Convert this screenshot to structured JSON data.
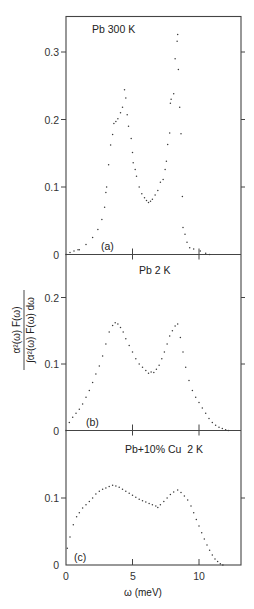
{
  "figure": {
    "xlabel": "ω (meV)",
    "ylabel_numerator": "α²(ω) F(ω)",
    "ylabel_denominator": "∫α²(ω) F(ω) dω",
    "x_ticks": [
      0,
      5,
      10
    ],
    "x_tick_labels": [
      "0",
      "5",
      "10"
    ]
  },
  "chart_data": [
    {
      "type": "scatter",
      "panel": "(a)",
      "title": "Pb 300 K",
      "xlabel": "ω (meV)",
      "ylabel": "α²(ω)F(ω) / ∫α²(ω)F(ω)dω",
      "xlim": [
        0,
        13.2
      ],
      "ylim": [
        0,
        0.35
      ],
      "y_ticks": [
        0,
        0.1,
        0.2,
        0.3
      ],
      "y_tick_labels": [
        "0",
        "0.1",
        "0.2",
        "0.3"
      ],
      "grid": false,
      "x": [
        0.0,
        0.3,
        0.6,
        0.9,
        1.0,
        1.5,
        2.0,
        2.4,
        2.7,
        2.9,
        3.0,
        3.05,
        3.2,
        3.35,
        3.5,
        3.6,
        3.75,
        3.9,
        4.1,
        4.25,
        4.4,
        4.5,
        4.6,
        4.7,
        4.9,
        5.0,
        5.05,
        5.2,
        5.3,
        5.5,
        5.7,
        5.9,
        6.05,
        6.2,
        6.35,
        6.5,
        6.7,
        6.9,
        7.1,
        7.3,
        7.45,
        7.55,
        7.65,
        7.8,
        7.85,
        7.9,
        8.1,
        8.2,
        8.35,
        8.4,
        8.45,
        8.55,
        8.65,
        8.75,
        8.8,
        8.95,
        9.1,
        9.3,
        9.6,
        10.1,
        10.5,
        10.8
      ],
      "y": [
        0.0,
        0.003,
        0.005,
        0.007,
        0.007,
        0.015,
        0.025,
        0.037,
        0.052,
        0.07,
        0.092,
        0.1,
        0.133,
        0.162,
        0.178,
        0.194,
        0.197,
        0.201,
        0.21,
        0.218,
        0.244,
        0.232,
        0.207,
        0.19,
        0.172,
        0.151,
        0.136,
        0.126,
        0.116,
        0.1,
        0.09,
        0.084,
        0.08,
        0.077,
        0.079,
        0.082,
        0.088,
        0.095,
        0.107,
        0.111,
        0.126,
        0.138,
        0.163,
        0.18,
        0.224,
        0.23,
        0.238,
        0.29,
        0.316,
        0.326,
        0.274,
        0.218,
        0.179,
        0.086,
        0.04,
        0.03,
        0.018,
        0.01,
        0.008,
        0.005,
        0.002,
        0.0
      ]
    },
    {
      "type": "scatter",
      "panel": "(b)",
      "title": "Pb 2 K",
      "xlabel": "ω (meV)",
      "ylabel": "α²(ω)F(ω) / ∫α²(ω)F(ω)dω",
      "xlim": [
        0,
        13.2
      ],
      "ylim": [
        0,
        0.26
      ],
      "y_ticks": [
        0,
        0.1,
        0.2
      ],
      "y_tick_labels": [
        "0",
        "0.1",
        "0.2"
      ],
      "grid": false,
      "x": [
        0.0,
        0.25,
        0.5,
        0.75,
        1.0,
        1.25,
        1.5,
        1.75,
        2.0,
        2.25,
        2.5,
        2.75,
        3.0,
        3.25,
        3.5,
        3.7,
        3.9,
        4.1,
        4.3,
        4.5,
        4.75,
        5.0,
        5.25,
        5.5,
        5.75,
        6.0,
        6.2,
        6.4,
        6.6,
        6.8,
        7.0,
        7.2,
        7.4,
        7.6,
        7.8,
        8.0,
        8.2,
        8.4,
        8.6,
        8.8,
        9.0,
        9.25,
        9.5,
        9.75,
        10.0,
        10.25,
        10.5,
        10.75,
        11.0,
        11.25,
        11.5,
        11.75,
        12.0,
        12.2
      ],
      "y": [
        0.0,
        0.012,
        0.02,
        0.026,
        0.032,
        0.04,
        0.05,
        0.06,
        0.072,
        0.085,
        0.097,
        0.112,
        0.13,
        0.148,
        0.158,
        0.162,
        0.16,
        0.155,
        0.148,
        0.138,
        0.128,
        0.118,
        0.108,
        0.1,
        0.095,
        0.09,
        0.086,
        0.088,
        0.087,
        0.092,
        0.098,
        0.108,
        0.118,
        0.13,
        0.142,
        0.15,
        0.157,
        0.16,
        0.14,
        0.118,
        0.095,
        0.075,
        0.06,
        0.05,
        0.042,
        0.034,
        0.026,
        0.018,
        0.012,
        0.008,
        0.005,
        0.003,
        0.001,
        0.0
      ]
    },
    {
      "type": "scatter",
      "panel": "(c)",
      "title": "Pb+10% Cu  2 K",
      "xlabel": "ω (meV)",
      "ylabel": "α²(ω)F(ω) / ∫α²(ω)F(ω)dω",
      "xlim": [
        0,
        13.2
      ],
      "ylim": [
        0,
        0.19
      ],
      "y_ticks": [
        0,
        0.1
      ],
      "y_tick_labels": [
        "0",
        "0.1"
      ],
      "grid": false,
      "x": [
        0.1,
        0.3,
        0.55,
        0.8,
        1.0,
        1.25,
        1.5,
        1.75,
        2.0,
        2.25,
        2.5,
        2.75,
        3.0,
        3.25,
        3.5,
        3.75,
        4.0,
        4.25,
        4.5,
        4.75,
        5.0,
        5.25,
        5.5,
        5.75,
        6.0,
        6.25,
        6.5,
        6.75,
        6.9,
        7.1,
        7.35,
        7.6,
        7.85,
        8.1,
        8.4,
        8.65,
        8.9,
        9.15,
        9.4,
        9.6,
        9.8,
        10.0,
        10.2,
        10.4,
        10.6,
        10.8,
        11.0,
        11.2,
        11.4,
        11.6,
        11.8
      ],
      "y": [
        0.025,
        0.042,
        0.06,
        0.072,
        0.078,
        0.085,
        0.09,
        0.095,
        0.1,
        0.106,
        0.11,
        0.113,
        0.115,
        0.117,
        0.119,
        0.118,
        0.116,
        0.113,
        0.11,
        0.107,
        0.104,
        0.101,
        0.098,
        0.096,
        0.094,
        0.092,
        0.09,
        0.088,
        0.086,
        0.09,
        0.095,
        0.1,
        0.105,
        0.109,
        0.112,
        0.108,
        0.103,
        0.097,
        0.088,
        0.078,
        0.068,
        0.058,
        0.048,
        0.039,
        0.03,
        0.022,
        0.015,
        0.009,
        0.005,
        0.002,
        0.0
      ]
    }
  ]
}
